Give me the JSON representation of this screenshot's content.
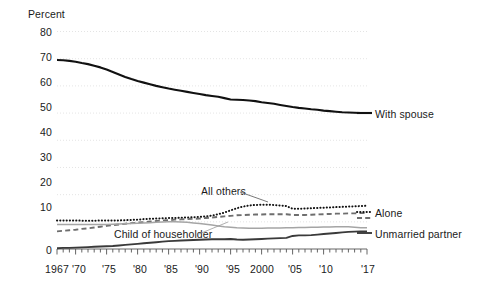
{
  "chart_data": {
    "type": "line",
    "title": "",
    "ylabel": "Percent",
    "xlabel": "",
    "ylim": [
      0,
      80
    ],
    "xlim": [
      1967,
      2017
    ],
    "grid": true,
    "legend_position": "right-inline",
    "ytick_labels": [
      "80",
      "70",
      "60",
      "50",
      "40",
      "30",
      "20",
      "10",
      "0"
    ],
    "ytick_values": [
      80,
      70,
      60,
      50,
      40,
      30,
      20,
      10,
      0
    ],
    "xtick_labels": [
      "1967",
      "'70",
      "'75",
      "'80",
      "'85",
      "'90",
      "'95",
      "2000",
      "'05",
      "'10",
      "'17"
    ],
    "xtick_values": [
      1967,
      1970,
      1975,
      1980,
      1985,
      1990,
      1995,
      2000,
      2005,
      2010,
      2017
    ],
    "minor_tick_interval": 1,
    "annotations": [
      {
        "text": "All others",
        "points_to": "Alone",
        "x": 1990,
        "y": 22
      },
      {
        "text": "Child of householder",
        "points_to": "Child of householder",
        "x": 1977,
        "y": 6.5
      }
    ],
    "series": [
      {
        "name": "With spouse",
        "style": "solid-thick-black",
        "color": "#111111",
        "x": [
          1967,
          1968,
          1969,
          1970,
          1971,
          1972,
          1973,
          1974,
          1975,
          1976,
          1977,
          1978,
          1979,
          1980,
          1981,
          1982,
          1983,
          1984,
          1985,
          1986,
          1987,
          1988,
          1989,
          1990,
          1991,
          1992,
          1993,
          1994,
          1995,
          1996,
          1997,
          1998,
          1999,
          2000,
          2001,
          2002,
          2003,
          2004,
          2005,
          2006,
          2007,
          2008,
          2009,
          2010,
          2011,
          2012,
          2013,
          2014,
          2015,
          2016,
          2017
        ],
        "values": [
          69.5,
          69.4,
          69.2,
          68.9,
          68.4,
          68.0,
          67.4,
          66.8,
          66.0,
          65.1,
          64.2,
          63.3,
          62.5,
          61.8,
          61.2,
          60.6,
          60.0,
          59.5,
          59.0,
          58.6,
          58.2,
          57.8,
          57.4,
          57.0,
          56.6,
          56.3,
          56.0,
          55.5,
          55.0,
          54.9,
          54.8,
          54.6,
          54.4,
          54.0,
          53.7,
          53.4,
          53.0,
          52.6,
          52.2,
          51.9,
          51.7,
          51.4,
          51.2,
          50.9,
          50.7,
          50.5,
          50.3,
          50.2,
          50.1,
          50.0,
          50.0
        ]
      },
      {
        "name": "Alone",
        "style": "dotted-black",
        "color": "#111111",
        "x": [
          1967,
          1968,
          1969,
          1970,
          1971,
          1972,
          1973,
          1974,
          1975,
          1976,
          1977,
          1978,
          1979,
          1980,
          1981,
          1982,
          1983,
          1984,
          1985,
          1986,
          1987,
          1988,
          1989,
          1990,
          1991,
          1992,
          1993,
          1994,
          1995,
          1996,
          1997,
          1998,
          1999,
          2000,
          2001,
          2002,
          2003,
          2004,
          2005,
          2006,
          2007,
          2008,
          2009,
          2010,
          2011,
          2012,
          2013,
          2014,
          2015,
          2016,
          2017
        ],
        "values": [
          10.5,
          10.5,
          10.5,
          10.5,
          10.4,
          10.4,
          10.4,
          10.5,
          10.5,
          10.5,
          10.5,
          10.6,
          10.7,
          10.8,
          11.0,
          11.1,
          11.2,
          11.3,
          11.4,
          11.4,
          11.5,
          11.6,
          11.7,
          11.8,
          12.0,
          12.3,
          12.8,
          13.4,
          14.2,
          15.0,
          15.6,
          16.0,
          16.2,
          16.3,
          16.3,
          16.2,
          16.0,
          15.8,
          14.8,
          14.8,
          14.9,
          15.0,
          15.1,
          15.2,
          15.3,
          15.4,
          15.5,
          15.6,
          15.7,
          15.8,
          15.9
        ]
      },
      {
        "name": "Child of householder",
        "style": "dashed-gray",
        "color": "#6e6e6e",
        "x": [
          1967,
          1968,
          1969,
          1970,
          1971,
          1972,
          1973,
          1974,
          1975,
          1976,
          1977,
          1978,
          1979,
          1980,
          1981,
          1982,
          1983,
          1984,
          1985,
          1986,
          1987,
          1988,
          1989,
          1990,
          1991,
          1992,
          1993,
          1994,
          1995,
          1996,
          1997,
          1998,
          1999,
          2000,
          2001,
          2002,
          2003,
          2004,
          2005,
          2006,
          2007,
          2008,
          2009,
          2010,
          2011,
          2012,
          2013,
          2014,
          2015,
          2016,
          2017
        ],
        "values": [
          6.5,
          6.7,
          6.9,
          7.1,
          7.4,
          7.6,
          7.9,
          8.2,
          8.5,
          8.8,
          9.0,
          9.3,
          9.5,
          9.7,
          9.9,
          10.1,
          10.3,
          10.5,
          10.6,
          10.8,
          10.9,
          11.0,
          11.1,
          11.2,
          11.4,
          11.6,
          11.8,
          12.0,
          12.2,
          12.4,
          12.5,
          12.6,
          12.7,
          12.7,
          12.8,
          12.8,
          12.8,
          12.8,
          12.5,
          12.5,
          12.5,
          12.6,
          12.7,
          12.8,
          12.9,
          13.0,
          13.0,
          13.1,
          13.1,
          13.2,
          13.2
        ]
      },
      {
        "name": "Unmarried partner",
        "style": "solid-lightgray",
        "color": "#a5a5a5",
        "x": [
          1967,
          1968,
          1969,
          1970,
          1971,
          1972,
          1973,
          1974,
          1975,
          1976,
          1977,
          1978,
          1979,
          1980,
          1981,
          1982,
          1983,
          1984,
          1985,
          1986,
          1987,
          1988,
          1989,
          1990,
          1991,
          1992,
          1993,
          1994,
          1995,
          1996,
          1997,
          1998,
          1999,
          2000,
          2001,
          2002,
          2003,
          2004,
          2005,
          2006,
          2007,
          2008,
          2009,
          2010,
          2011,
          2012,
          2013,
          2014,
          2015,
          2016,
          2017
        ],
        "values": [
          9.0,
          9.0,
          9.0,
          9.0,
          9.0,
          9.0,
          9.0,
          9.0,
          9.0,
          9.1,
          9.2,
          9.3,
          9.4,
          9.5,
          9.6,
          9.7,
          9.8,
          9.9,
          10.0,
          10.0,
          9.9,
          9.8,
          9.6,
          9.4,
          9.1,
          8.8,
          8.5,
          8.2,
          8.0,
          7.8,
          7.7,
          7.6,
          7.6,
          7.6,
          7.7,
          7.7,
          7.7,
          7.8,
          7.8,
          7.9,
          7.9,
          8.0,
          8.0,
          8.1,
          8.1,
          8.2,
          8.2,
          8.2,
          8.0,
          7.8,
          7.8
        ]
      },
      {
        "name": "Unmarried partner solid dark",
        "style": "solid-dark",
        "color": "#3a3a3a",
        "x": [
          1967,
          1968,
          1969,
          1970,
          1971,
          1972,
          1973,
          1974,
          1975,
          1976,
          1977,
          1978,
          1979,
          1980,
          1981,
          1982,
          1983,
          1984,
          1985,
          1986,
          1987,
          1988,
          1989,
          1990,
          1991,
          1992,
          1993,
          1994,
          1995,
          1996,
          1997,
          1998,
          1999,
          2000,
          2001,
          2002,
          2003,
          2004,
          2005,
          2006,
          2007,
          2008,
          2009,
          2010,
          2011,
          2012,
          2013,
          2014,
          2015,
          2016,
          2017
        ],
        "values": [
          0.3,
          0.4,
          0.4,
          0.5,
          0.6,
          0.7,
          0.8,
          0.9,
          1.0,
          1.1,
          1.3,
          1.5,
          1.7,
          1.9,
          2.1,
          2.3,
          2.5,
          2.7,
          2.9,
          3.0,
          3.1,
          3.2,
          3.3,
          3.4,
          3.5,
          3.6,
          3.6,
          3.6,
          3.7,
          3.5,
          3.4,
          3.5,
          3.6,
          3.7,
          3.8,
          3.9,
          4.0,
          4.1,
          4.8,
          5.0,
          5.0,
          5.1,
          5.3,
          5.5,
          5.7,
          5.9,
          6.1,
          6.3,
          6.4,
          6.5,
          6.5
        ]
      }
    ],
    "inline_series_labels": [
      {
        "label": "With spouse",
        "series": "With spouse"
      },
      {
        "label": "Alone",
        "series": "Alone"
      },
      {
        "label": "Unmarried partner",
        "series": "Unmarried partner"
      }
    ]
  },
  "axis": {
    "y_title": "Percent"
  },
  "labels": {
    "with_spouse": "With spouse",
    "alone": "Alone",
    "unmarried_partner": "Unmarried partner",
    "all_others": "All others",
    "child_of_householder": "Child of householder"
  },
  "yticks": [
    "80",
    "70",
    "60",
    "50",
    "40",
    "30",
    "20",
    "10",
    "0"
  ],
  "xticks": [
    "1967",
    "'70",
    "'75",
    "'80",
    "'85",
    "'90",
    "'95",
    "2000",
    "'05",
    "'10",
    "'17"
  ],
  "colors": {
    "with_spouse": "#111111",
    "alone": "#111111",
    "child_of_householder": "#6e6e6e",
    "unmarried_partner_light": "#a5a5a5",
    "unmarried_partner_dark": "#3a3a3a",
    "grid": "#dddddd",
    "background": "#ffffff"
  }
}
